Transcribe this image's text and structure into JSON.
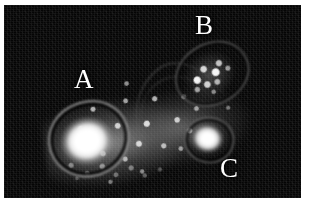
{
  "figure": {
    "plate_background_color": "#050505",
    "paper_background_color": "#ffffff",
    "label_color": "#ffffff",
    "core_color": "#ffffff",
    "image_type": "grayscale-intensity-map"
  },
  "labels": [
    {
      "id": "a",
      "text": "A",
      "description": "bright saturated core, left of center"
    },
    {
      "id": "b",
      "text": "B",
      "description": "knotty lobe, upper right"
    },
    {
      "id": "c",
      "text": "C",
      "description": "secondary bright core, right of center"
    }
  ],
  "chart_data": {
    "type": "heatmap",
    "xlabel": "",
    "ylabel": "",
    "grid": false,
    "legend": "none",
    "colormap": "grayscale",
    "background": "black",
    "annotations": [
      {
        "label": "A",
        "x": 0.23,
        "y": 0.34
      },
      {
        "label": "B",
        "x": 0.64,
        "y": 0.06
      },
      {
        "label": "C",
        "x": 0.72,
        "y": 0.78
      }
    ],
    "components": [
      {
        "name": "A",
        "feature": "saturated-core",
        "peak_intensity": 255,
        "center_x": 0.27,
        "center_y": 0.68,
        "extent_x": 0.21,
        "extent_y": 0.29,
        "has_contour_ring": true
      },
      {
        "name": "B",
        "feature": "knotty-lobe",
        "peak_intensity": 235,
        "center_x": 0.7,
        "center_y": 0.33,
        "extent_x": 0.21,
        "extent_y": 0.26,
        "has_contour_ring": true
      },
      {
        "name": "C",
        "feature": "secondary-core",
        "peak_intensity": 252,
        "center_x": 0.68,
        "center_y": 0.7,
        "extent_x": 0.13,
        "extent_y": 0.18,
        "has_contour_ring": true
      },
      {
        "name": "bridge",
        "feature": "speckled-diffuse-emission",
        "peak_intensity": 190,
        "center_x": 0.5,
        "center_y": 0.6,
        "extent_x": 0.62,
        "extent_y": 0.58,
        "has_contour_ring": false
      },
      {
        "name": "tail",
        "feature": "sparse-knots",
        "peak_intensity": 140,
        "center_x": 0.36,
        "center_y": 0.88,
        "extent_x": 0.4,
        "extent_y": 0.2,
        "has_contour_ring": false
      }
    ]
  }
}
